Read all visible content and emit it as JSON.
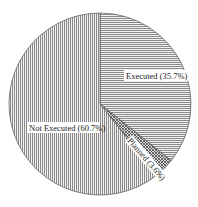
{
  "chart_data": {
    "type": "pie",
    "title": "",
    "slices": [
      {
        "label": "Executed",
        "value": 35.7,
        "display": "Executed (35.7%)",
        "pattern": "horizontal-lines"
      },
      {
        "label": "Planned",
        "value": 3.6,
        "display": "Planned (3.6%)",
        "pattern": "crosshatch"
      },
      {
        "label": "Not Executed",
        "value": 60.7,
        "display": "Not Executed (60.7%)",
        "pattern": "vertical-lines"
      }
    ],
    "start_angle_deg": 0,
    "direction": "clockwise",
    "legend": "none",
    "labels_inside": true
  },
  "labels": {
    "executed": "Executed (35.7%)",
    "planned": "Planned (3.6%)",
    "not_executed": "Not Executed (60.7%)"
  }
}
